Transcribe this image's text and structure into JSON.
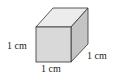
{
  "figure": {
    "shape": "cube",
    "labels": {
      "left_edge": "1 cm",
      "right_edge": "1 cm",
      "bottom_edge": "1 cm"
    },
    "colors": {
      "front_face": "#d9d9d9",
      "top_face": "#ececec",
      "right_face": "#c4c4c4",
      "edge": "#333333"
    }
  }
}
